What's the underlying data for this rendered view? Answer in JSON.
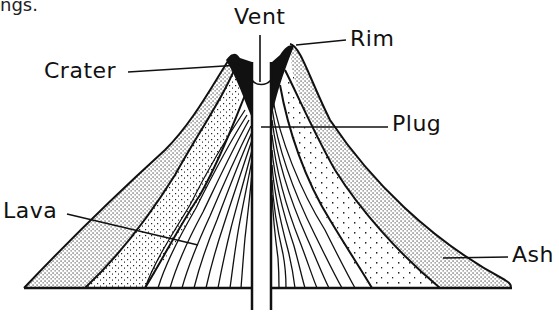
{
  "fragment_text": "ngs.",
  "diagram": {
    "labels": {
      "vent": "Vent",
      "rim": "Rim",
      "crater": "Crater",
      "plug": "Plug",
      "lava": "Lava",
      "ash": "Ash"
    }
  }
}
